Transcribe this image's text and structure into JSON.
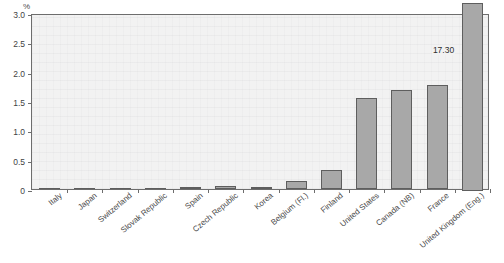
{
  "chart_data": {
    "type": "bar",
    "title": "",
    "xlabel": "",
    "ylabel": "%",
    "ylim": [
      0,
      3.0
    ],
    "ytick_labels": [
      "0",
      "0.5",
      "1.0",
      "1.5",
      "2.0",
      "2.5",
      "3.0"
    ],
    "ytick_values": [
      0,
      0.5,
      1.0,
      1.5,
      2.0,
      2.5,
      3.0
    ],
    "grid": false,
    "legend": "none",
    "categories": [
      "Italy",
      "Japan",
      "Switzerland",
      "Slovak Republic",
      "Spain",
      "Czech Republic",
      "Korea",
      "Belgium (Fl.)",
      "Finland",
      "United States",
      "Canada (NB)",
      "France",
      "United Kingdom (Eng.)"
    ],
    "values": [
      0.0,
      0.0,
      0.0,
      0.0,
      0.03,
      0.05,
      0.04,
      0.14,
      0.33,
      1.55,
      1.68,
      1.78,
      17.3
    ],
    "annotations": [
      {
        "category": "United Kingdom (Eng.)",
        "text": "17.30",
        "note": "bar exceeds axis maximum and is truncated at top of plot"
      }
    ],
    "bar_color": "#a8a8a8",
    "bar_edge_color": "#5e5e5e",
    "plot_background": "#f2f2f2",
    "axis_color": "#6d6d6d"
  }
}
